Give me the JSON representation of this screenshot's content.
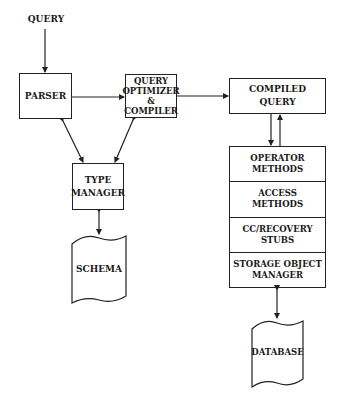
{
  "diagram": {
    "input_label": "QUERY",
    "nodes": {
      "parser": "PARSER",
      "optimizer": "QUERY\nOPTIMIZER\n&\nCOMPILER",
      "compiled_query": "COMPILED\nQUERY",
      "type_manager": "TYPE\nMANAGER",
      "schema": "SCHEMA",
      "database": "DATABASE"
    },
    "stack_layers": [
      {
        "label": "OPERATOR\nMETHODS"
      },
      {
        "label": "ACCESS\nMETHODS"
      },
      {
        "label": "CC/RECOVERY\nSTUBS"
      },
      {
        "label": "STORAGE OBJECT\nMANAGER"
      }
    ],
    "edges": [
      {
        "from": "QUERY",
        "to": "PARSER",
        "dir": "forward"
      },
      {
        "from": "PARSER",
        "to": "QUERY OPTIMIZER & COMPILER",
        "dir": "forward"
      },
      {
        "from": "QUERY OPTIMIZER & COMPILER",
        "to": "COMPILED QUERY",
        "dir": "forward"
      },
      {
        "from": "PARSER",
        "to": "TYPE MANAGER",
        "dir": "both"
      },
      {
        "from": "QUERY OPTIMIZER & COMPILER",
        "to": "TYPE MANAGER",
        "dir": "both"
      },
      {
        "from": "TYPE MANAGER",
        "to": "SCHEMA",
        "dir": "both"
      },
      {
        "from": "COMPILED QUERY",
        "to": "OPERATOR METHODS",
        "dir": "forward"
      },
      {
        "from": "OPERATOR METHODS",
        "to": "COMPILED QUERY",
        "dir": "forward"
      },
      {
        "from": "STORAGE OBJECT MANAGER",
        "to": "DATABASE",
        "dir": "both"
      }
    ],
    "colors": {
      "line": "#222222",
      "background": "#ffffff"
    }
  }
}
